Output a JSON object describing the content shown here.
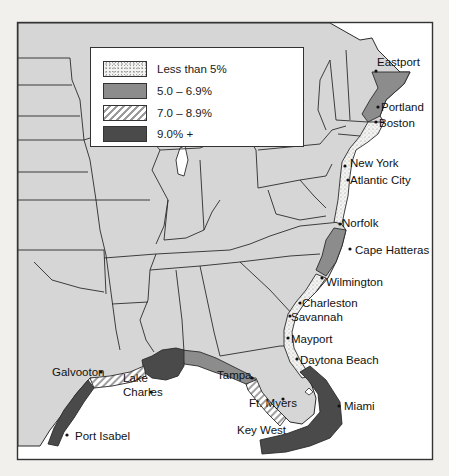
{
  "colors": {
    "page_bg": "#f1f0ec",
    "land": "#d6d6d6",
    "water": "#ffffff",
    "border_line": "#2b2b2b",
    "less_than_5": "#f3f3f1",
    "5_to_6_9": "#8c8c8c",
    "7_to_8_9": "hatched",
    "9_plus": "#4a4a4a"
  },
  "legend": {
    "items": [
      {
        "label": "Less than 5%",
        "pattern": "dots"
      },
      {
        "label": "5.0 – 6.9%",
        "pattern": "medium-gray"
      },
      {
        "label": "7.0 – 8.9%",
        "pattern": "diagonal-hatch"
      },
      {
        "label": "9.0% +",
        "pattern": "dark-gray"
      }
    ]
  },
  "cities": [
    {
      "name": "Eastport",
      "category": "5.0 – 6.9%"
    },
    {
      "name": "Portland",
      "category": "5.0 – 6.9%"
    },
    {
      "name": "Boston",
      "category": "Less than 5%"
    },
    {
      "name": "New York",
      "category": "Less than 5%"
    },
    {
      "name": "Atlantic City",
      "category": "Less than 5%"
    },
    {
      "name": "Norfolk",
      "category": "Less than 5%"
    },
    {
      "name": "Cape Hatteras",
      "category": "5.0 – 6.9%"
    },
    {
      "name": "Wilmington",
      "category": "Less than 5%"
    },
    {
      "name": "Charleston",
      "category": "Less than 5%"
    },
    {
      "name": "Savannah",
      "category": "Less than 5%"
    },
    {
      "name": "Mayport",
      "category": "Less than 5%"
    },
    {
      "name": "Daytona Beach",
      "category": "9.0% +"
    },
    {
      "name": "Miami",
      "category": "9.0% +"
    },
    {
      "name": "Key West",
      "category": "9.0% +"
    },
    {
      "name": "Ft. Myers",
      "category": "7.0 – 8.9%"
    },
    {
      "name": "Tampa",
      "category": "5.0 – 6.9%"
    },
    {
      "name": "Lake Charles",
      "line1": "Lake",
      "line2": "Charles",
      "category": "9.0% +"
    },
    {
      "name": "Galvooton",
      "category": "7.0 – 8.9%"
    },
    {
      "name": "Port Isabel",
      "category": "9.0% +"
    }
  ]
}
